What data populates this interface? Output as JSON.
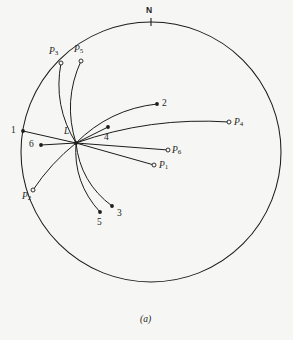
{
  "figure": {
    "caption": "(a)",
    "north_label": "N",
    "center_label": "L",
    "background_color": "#f6f6f4",
    "ink_color": "#1d1d1d",
    "primitive_circle": {
      "cx": 151,
      "cy": 152,
      "r": 130
    },
    "center_point": {
      "x": 76,
      "y": 143
    },
    "north_tick": {
      "x": 151,
      "y": 22,
      "length": 8
    }
  },
  "chart_data": {
    "type": "scatter",
    "title": "(a)",
    "xlabel": "",
    "ylabel": "",
    "grid": false,
    "legend": "none",
    "projection": "stereographic",
    "annotations": [
      "N",
      "L",
      "(a)"
    ],
    "primitive_circle": {
      "cx": 151,
      "cy": 152,
      "r": 130
    },
    "origin": {
      "label": "L",
      "x": 76,
      "y": 143,
      "marker": "filled-dot"
    },
    "series": [
      {
        "name": "pole-points",
        "marker": "open-circle",
        "points": [
          {
            "label": "P1",
            "x": 154,
            "y": 165,
            "label_x": 159,
            "label_y": 161
          },
          {
            "label": "P2",
            "x": 33,
            "y": 190,
            "label_x": 22,
            "label_y": 192
          },
          {
            "label": "P3",
            "x": 61,
            "y": 63,
            "label_x": 49,
            "label_y": 47
          },
          {
            "label": "P4",
            "x": 229,
            "y": 122,
            "label_x": 234,
            "label_y": 118
          },
          {
            "label": "P5",
            "x": 81,
            "y": 61,
            "label_x": 74,
            "label_y": 45
          },
          {
            "label": "P6",
            "x": 168,
            "y": 150,
            "label_x": 172,
            "label_y": 146
          }
        ]
      },
      {
        "name": "numbered-points",
        "marker": "filled-dot",
        "points": [
          {
            "label": "1",
            "x": 23,
            "y": 131,
            "label_x": 11,
            "label_y": 126
          },
          {
            "label": "2",
            "x": 157,
            "y": 104,
            "label_x": 162,
            "label_y": 99
          },
          {
            "label": "3",
            "x": 112,
            "y": 206,
            "label_x": 117,
            "label_y": 209
          },
          {
            "label": "4",
            "x": 108,
            "y": 127,
            "label_x": 104,
            "label_y": 133
          },
          {
            "label": "5",
            "x": 100,
            "y": 212,
            "label_x": 97,
            "label_y": 218
          },
          {
            "label": "6",
            "x": 41,
            "y": 145,
            "label_x": 29,
            "label_y": 140
          }
        ]
      }
    ],
    "arcs": [
      {
        "name": "L-to-P1",
        "from": "L",
        "to": "P1",
        "curvature": "straight"
      },
      {
        "name": "L-to-P2",
        "from": "L",
        "to": "P2",
        "curvature": "slight"
      },
      {
        "name": "L-to-P3",
        "from": "L",
        "to": "P3",
        "curvature": "strong"
      },
      {
        "name": "L-to-P4",
        "from": "L",
        "to": "P4",
        "curvature": "strong"
      },
      {
        "name": "L-to-P5",
        "from": "L",
        "to": "P5",
        "curvature": "strong"
      },
      {
        "name": "L-to-P6",
        "from": "L",
        "to": "P6",
        "curvature": "straight"
      },
      {
        "name": "L-to-1",
        "from": "L",
        "to": "1",
        "curvature": "straight"
      },
      {
        "name": "L-to-2",
        "from": "L",
        "to": "2",
        "curvature": "strong"
      },
      {
        "name": "L-to-3",
        "from": "L",
        "to": "3",
        "curvature": "strong"
      },
      {
        "name": "L-to-4",
        "from": "L",
        "to": "4",
        "curvature": "straight"
      },
      {
        "name": "L-to-5",
        "from": "L",
        "to": "5",
        "curvature": "strong"
      },
      {
        "name": "L-to-6",
        "from": "L",
        "to": "6",
        "curvature": "straight"
      }
    ]
  }
}
